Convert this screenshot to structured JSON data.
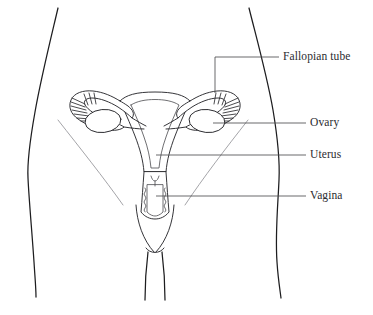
{
  "diagram": {
    "background_color": "#ffffff",
    "outline_color": "#1d1d1f",
    "organ_color": "#2a2a2e",
    "crease_color": "#9a9a9e",
    "leader_color": "#4e4e52",
    "text_color": "#2b2b2f"
  },
  "labels": [
    {
      "id": "fallopian-tube",
      "text": "Fallopian tube",
      "x": 283,
      "y": 52,
      "leader_type": "elbow"
    },
    {
      "id": "ovary",
      "text": "Ovary",
      "x": 310,
      "y": 118,
      "leader_type": "straight"
    },
    {
      "id": "uterus",
      "text": "Uterus",
      "x": 310,
      "y": 150,
      "leader_type": "straight"
    },
    {
      "id": "vagina",
      "text": "Vagina",
      "x": 310,
      "y": 191,
      "leader_type": "straight"
    }
  ],
  "structures": [
    {
      "id": "body-torso",
      "name": "torso-outline"
    },
    {
      "id": "uterus-body",
      "name": "uterus"
    },
    {
      "id": "fallopian-tube-left",
      "name": "left-fallopian-tube"
    },
    {
      "id": "fallopian-tube-right",
      "name": "right-fallopian-tube"
    },
    {
      "id": "ovary-left",
      "name": "left-ovary"
    },
    {
      "id": "ovary-right",
      "name": "right-ovary"
    },
    {
      "id": "cervix",
      "name": "cervix"
    },
    {
      "id": "vaginal-canal",
      "name": "vaginal-canal"
    }
  ]
}
